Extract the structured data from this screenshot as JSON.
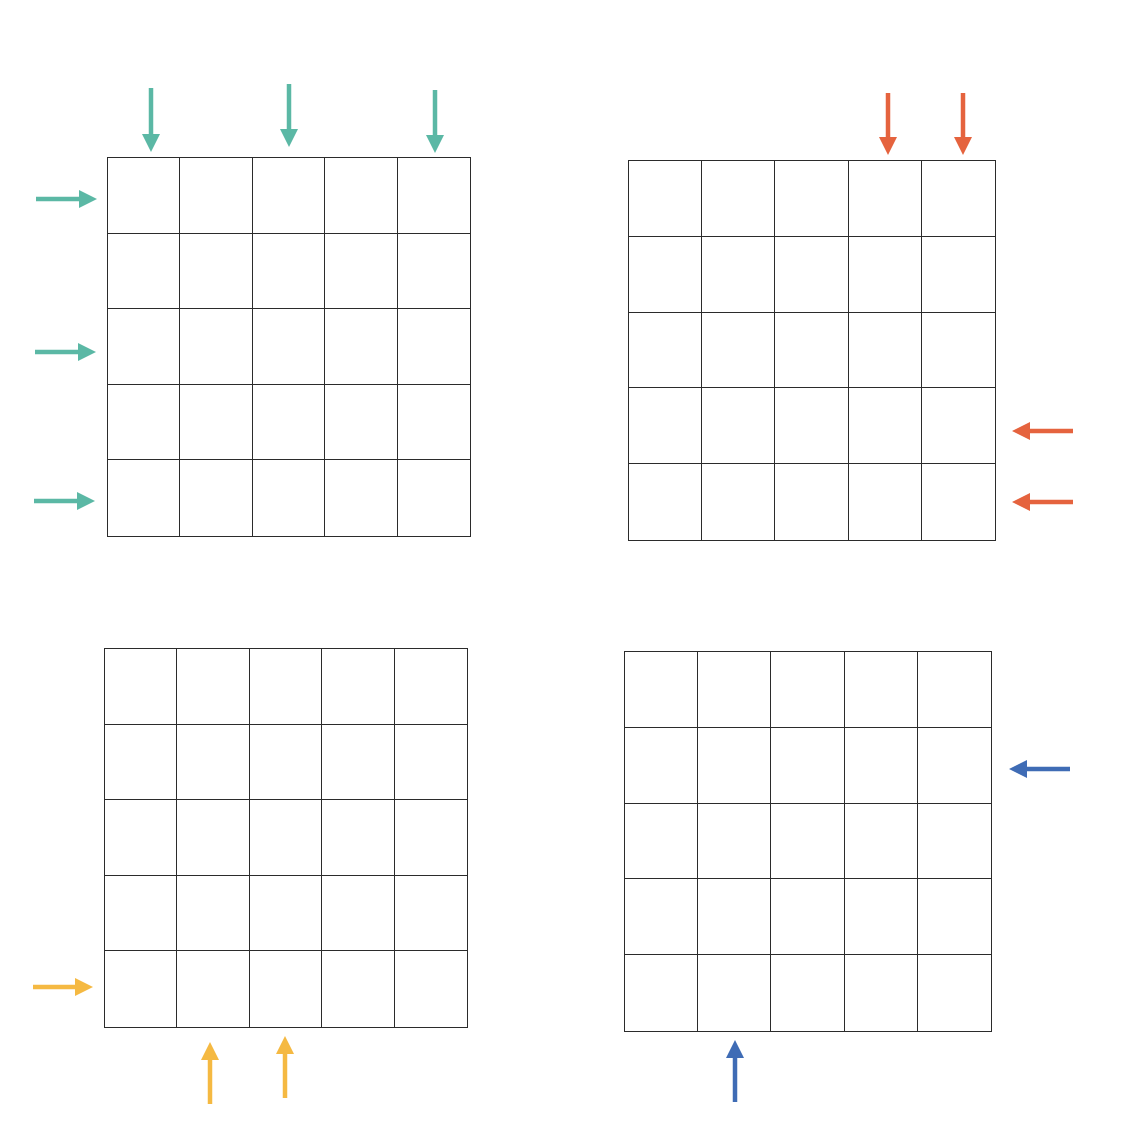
{
  "colors": {
    "teal": "#5bb8a5",
    "orange": "#e5633e",
    "yellow": "#f5b942",
    "blue": "#3f6cb5",
    "grid_line": "#2b2b2b",
    "background": "#ffffff"
  },
  "panels": [
    {
      "id": "top-left",
      "color_name": "teal",
      "grid": {
        "x": 107,
        "y": 157,
        "w": 364,
        "h": 380,
        "rows": 5,
        "cols": 5
      },
      "arrows": [
        {
          "direction": "down",
          "side": "top",
          "index": 0,
          "x": 151,
          "y1": 88,
          "y2": 152
        },
        {
          "direction": "down",
          "side": "top",
          "index": 2,
          "x": 289,
          "y1": 84,
          "y2": 147
        },
        {
          "direction": "down",
          "side": "top",
          "index": 4,
          "x": 435,
          "y1": 90,
          "y2": 153
        },
        {
          "direction": "right",
          "side": "left",
          "index": 0,
          "y": 199,
          "x1": 36,
          "x2": 97
        },
        {
          "direction": "right",
          "side": "left",
          "index": 2,
          "y": 352,
          "x1": 35,
          "x2": 96
        },
        {
          "direction": "right",
          "side": "left",
          "index": 4,
          "y": 501,
          "x1": 34,
          "x2": 95
        }
      ]
    },
    {
      "id": "top-right",
      "color_name": "orange",
      "grid": {
        "x": 628,
        "y": 160,
        "w": 368,
        "h": 381,
        "rows": 5,
        "cols": 5
      },
      "arrows": [
        {
          "direction": "down",
          "side": "top",
          "index": 3,
          "x": 888,
          "y1": 93,
          "y2": 155
        },
        {
          "direction": "down",
          "side": "top",
          "index": 4,
          "x": 963,
          "y1": 93,
          "y2": 155
        },
        {
          "direction": "left",
          "side": "right",
          "index": 3,
          "y": 431,
          "x1": 1073,
          "x2": 1012
        },
        {
          "direction": "left",
          "side": "right",
          "index": 4,
          "y": 502,
          "x1": 1073,
          "x2": 1012
        }
      ]
    },
    {
      "id": "bottom-left",
      "color_name": "yellow",
      "grid": {
        "x": 104,
        "y": 648,
        "w": 364,
        "h": 380,
        "rows": 5,
        "cols": 5
      },
      "arrows": [
        {
          "direction": "right",
          "side": "left",
          "index": 4,
          "y": 987,
          "x1": 33,
          "x2": 93
        },
        {
          "direction": "up",
          "side": "bottom",
          "index": 1,
          "x": 210,
          "y1": 1104,
          "y2": 1042
        },
        {
          "direction": "up",
          "side": "bottom",
          "index": 2,
          "x": 285,
          "y1": 1098,
          "y2": 1036
        }
      ]
    },
    {
      "id": "bottom-right",
      "color_name": "blue",
      "grid": {
        "x": 624,
        "y": 651,
        "w": 368,
        "h": 381,
        "rows": 5,
        "cols": 5
      },
      "arrows": [
        {
          "direction": "left",
          "side": "right",
          "index": 1,
          "y": 769,
          "x1": 1070,
          "x2": 1009
        },
        {
          "direction": "up",
          "side": "bottom",
          "index": 1,
          "x": 735,
          "y1": 1102,
          "y2": 1040
        }
      ]
    }
  ]
}
